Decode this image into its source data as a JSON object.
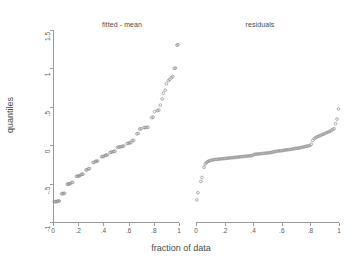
{
  "figure": {
    "ylabel": "quantiles",
    "xlabel": "fraction of data",
    "marker_color": "#8d8d8d",
    "axis_color": "#9a9a9a",
    "text_color": "#4a4a4a",
    "background": "#ffffff"
  },
  "panels": {
    "left": {
      "title": "fitted - mean"
    },
    "right": {
      "title": "residuals"
    }
  },
  "axes": {
    "y_ticks": [
      {
        "value": -1,
        "label": "-1"
      },
      {
        "value": -0.5,
        "label": "-.5"
      },
      {
        "value": 0,
        "label": "0"
      },
      {
        "value": 0.5,
        "label": ".5"
      },
      {
        "value": 1,
        "label": "1"
      },
      {
        "value": 1.5,
        "label": "1.5"
      }
    ],
    "x_ticks": [
      {
        "value": 0,
        "label": "0"
      },
      {
        "value": 0.2,
        "label": ".2"
      },
      {
        "value": 0.4,
        "label": ".4"
      },
      {
        "value": 0.6,
        "label": ".6"
      },
      {
        "value": 0.8,
        "label": ".8"
      },
      {
        "value": 1,
        "label": "1"
      }
    ]
  },
  "chart_data": {
    "type": "scatter",
    "title": "",
    "xlabel": "fraction of data",
    "ylabel": "quantiles",
    "xlim": [
      0,
      1
    ],
    "ylim": [
      -1,
      1.5
    ],
    "grid": false,
    "legend_position": "none",
    "marker": "open-circle",
    "panels": [
      {
        "name": "fitted - mean",
        "x": [
          0.01,
          0.018,
          0.026,
          0.034,
          0.042,
          0.05,
          0.068,
          0.076,
          0.084,
          0.092,
          0.112,
          0.12,
          0.128,
          0.136,
          0.148,
          0.156,
          0.186,
          0.194,
          0.202,
          0.21,
          0.222,
          0.23,
          0.238,
          0.262,
          0.27,
          0.282,
          0.29,
          0.318,
          0.326,
          0.338,
          0.346,
          0.354,
          0.386,
          0.394,
          0.402,
          0.414,
          0.422,
          0.43,
          0.452,
          0.462,
          0.472,
          0.482,
          0.492,
          0.512,
          0.522,
          0.532,
          0.542,
          0.552,
          0.562,
          0.588,
          0.598,
          0.608,
          0.618,
          0.63,
          0.64,
          0.666,
          0.676,
          0.688,
          0.698,
          0.722,
          0.732,
          0.742,
          0.754,
          0.782,
          0.794,
          0.806,
          0.828,
          0.84,
          0.852,
          0.866,
          0.876,
          0.89,
          0.9,
          0.916,
          0.926,
          0.94,
          0.95,
          0.962,
          0.972,
          0.984,
          0.992
        ],
        "y": [
          -0.735,
          -0.735,
          -0.735,
          -0.73,
          -0.728,
          -0.726,
          -0.632,
          -0.63,
          -0.628,
          -0.626,
          -0.508,
          -0.506,
          -0.504,
          -0.502,
          -0.486,
          -0.484,
          -0.406,
          -0.404,
          -0.402,
          -0.4,
          -0.382,
          -0.38,
          -0.378,
          -0.322,
          -0.32,
          -0.306,
          -0.304,
          -0.226,
          -0.224,
          -0.21,
          -0.208,
          -0.206,
          -0.15,
          -0.148,
          -0.146,
          -0.132,
          -0.13,
          -0.128,
          -0.096,
          -0.09,
          -0.086,
          -0.082,
          -0.078,
          -0.03,
          -0.026,
          -0.022,
          -0.018,
          -0.014,
          -0.01,
          0.022,
          0.026,
          0.03,
          0.034,
          0.06,
          0.062,
          0.148,
          0.152,
          0.212,
          0.214,
          0.228,
          0.23,
          0.232,
          0.234,
          0.36,
          0.364,
          0.436,
          0.452,
          0.456,
          0.522,
          0.602,
          0.676,
          0.718,
          0.8,
          0.84,
          0.856,
          0.88,
          0.892,
          1.0,
          1.004,
          1.302,
          1.31
        ],
        "note": "monotone increasing quantile trace with plateau clusters; steepens after 0.8"
      },
      {
        "name": "residuals",
        "x": [
          0.006,
          0.014,
          0.034,
          0.042,
          0.056,
          0.064,
          0.072,
          0.08,
          0.088,
          0.096,
          0.106,
          0.116,
          0.126,
          0.136,
          0.146,
          0.156,
          0.166,
          0.176,
          0.186,
          0.196,
          0.206,
          0.216,
          0.226,
          0.236,
          0.246,
          0.256,
          0.266,
          0.276,
          0.286,
          0.296,
          0.306,
          0.316,
          0.326,
          0.336,
          0.346,
          0.356,
          0.366,
          0.376,
          0.386,
          0.396,
          0.406,
          0.416,
          0.426,
          0.436,
          0.446,
          0.456,
          0.466,
          0.476,
          0.486,
          0.496,
          0.506,
          0.516,
          0.526,
          0.536,
          0.546,
          0.556,
          0.566,
          0.576,
          0.586,
          0.596,
          0.606,
          0.616,
          0.626,
          0.636,
          0.646,
          0.656,
          0.666,
          0.676,
          0.686,
          0.696,
          0.706,
          0.716,
          0.726,
          0.736,
          0.746,
          0.756,
          0.766,
          0.776,
          0.786,
          0.796,
          0.806,
          0.816,
          0.826,
          0.836,
          0.846,
          0.856,
          0.866,
          0.876,
          0.886,
          0.896,
          0.906,
          0.916,
          0.926,
          0.936,
          0.946,
          0.956,
          0.966,
          0.976,
          0.986,
          0.996
        ],
        "y": [
          -0.712,
          -0.62,
          -0.472,
          -0.42,
          -0.286,
          -0.246,
          -0.228,
          -0.216,
          -0.208,
          -0.202,
          -0.196,
          -0.192,
          -0.188,
          -0.186,
          -0.184,
          -0.182,
          -0.18,
          -0.178,
          -0.176,
          -0.174,
          -0.172,
          -0.17,
          -0.168,
          -0.166,
          -0.164,
          -0.162,
          -0.16,
          -0.158,
          -0.156,
          -0.154,
          -0.152,
          -0.15,
          -0.148,
          -0.146,
          -0.144,
          -0.142,
          -0.14,
          -0.138,
          -0.136,
          -0.134,
          -0.12,
          -0.118,
          -0.116,
          -0.114,
          -0.112,
          -0.11,
          -0.108,
          -0.106,
          -0.104,
          -0.102,
          -0.1,
          -0.098,
          -0.096,
          -0.09,
          -0.086,
          -0.082,
          -0.078,
          -0.076,
          -0.074,
          -0.072,
          -0.07,
          -0.066,
          -0.062,
          -0.06,
          -0.058,
          -0.056,
          -0.054,
          -0.05,
          -0.046,
          -0.042,
          -0.04,
          -0.038,
          -0.034,
          -0.03,
          -0.026,
          -0.022,
          -0.016,
          -0.012,
          -0.008,
          -0.004,
          0.012,
          0.062,
          0.086,
          0.098,
          0.108,
          0.116,
          0.124,
          0.132,
          0.14,
          0.148,
          0.156,
          0.164,
          0.172,
          0.18,
          0.192,
          0.204,
          0.216,
          0.28,
          0.34,
          0.472
        ],
        "note": "flat S-shaped residual quantile trace near -0.1 with two low outliers at far left and rising tail at far right"
      }
    ]
  }
}
